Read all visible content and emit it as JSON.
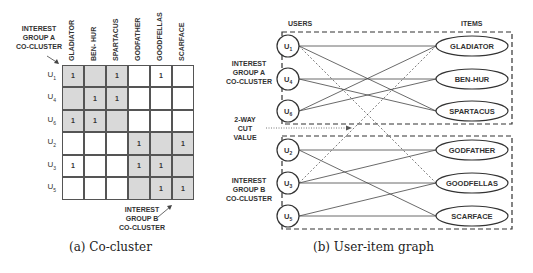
{
  "left_panel": {
    "caption": "(a) Co-cluster",
    "group_a_label": [
      "INTEREST",
      "GROUP A",
      "CO-CLUSTER"
    ],
    "group_b_label": [
      "INTEREST",
      "GROUP B",
      "CO-CLUSTER"
    ],
    "columns": [
      "GLADIATOR",
      "BEN- HUR",
      "SPARTACUS",
      "GODFATHER",
      "GOODFELLAS",
      "SCARFACE"
    ],
    "rows": [
      {
        "user": "U",
        "sub": "1",
        "cells": [
          "1",
          "",
          "1",
          "",
          "1",
          ""
        ]
      },
      {
        "user": "U",
        "sub": "4",
        "cells": [
          "",
          "1",
          "1",
          "",
          "",
          ""
        ]
      },
      {
        "user": "U",
        "sub": "6",
        "cells": [
          "1",
          "1",
          "",
          "",
          "",
          ""
        ]
      },
      {
        "user": "U",
        "sub": "2",
        "cells": [
          "",
          "",
          "",
          "1",
          "",
          "1"
        ]
      },
      {
        "user": "U",
        "sub": "3",
        "cells": [
          "1",
          "",
          "",
          "1",
          "1",
          ""
        ]
      },
      {
        "user": "U",
        "sub": "5",
        "cells": [
          "",
          "",
          "",
          "",
          "1",
          "1"
        ]
      }
    ],
    "shaded_color": "#d9d9d9"
  },
  "right_panel": {
    "caption": "(b) User-item graph",
    "users_header": "USERS",
    "items_header": "ITEMS",
    "group_a_label": [
      "INTEREST",
      "GROUP A",
      "CO-CLUSTER"
    ],
    "cut_label": [
      "2-WAY",
      "CUT",
      "VALUE"
    ],
    "group_b_label": [
      "INTEREST",
      "GROUP B",
      "CO-CLUSTER"
    ],
    "users": [
      {
        "name": "U",
        "sub": "1"
      },
      {
        "name": "U",
        "sub": "4"
      },
      {
        "name": "U",
        "sub": "6"
      },
      {
        "name": "U",
        "sub": "2"
      },
      {
        "name": "U",
        "sub": "3"
      },
      {
        "name": "U",
        "sub": "5"
      }
    ],
    "items": [
      "GLADIATOR",
      "BEN-HUR",
      "SPARTACUS",
      "GODFATHER",
      "GOODFELLAS",
      "SCARFACE"
    ],
    "edges_solid": [
      [
        0,
        0
      ],
      [
        0,
        2
      ],
      [
        1,
        1
      ],
      [
        1,
        2
      ],
      [
        2,
        0
      ],
      [
        2,
        1
      ],
      [
        3,
        3
      ],
      [
        3,
        5
      ],
      [
        4,
        3
      ],
      [
        4,
        4
      ],
      [
        5,
        4
      ],
      [
        5,
        5
      ]
    ],
    "edges_dashed": [
      [
        0,
        4
      ],
      [
        4,
        0
      ]
    ]
  }
}
